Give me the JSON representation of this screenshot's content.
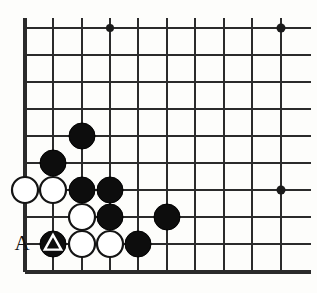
{
  "figure": {
    "kind": "go-board-diagram",
    "board_size": 19,
    "view": {
      "region": "bottom-left corner",
      "visible_columns": 10,
      "visible_rows": 10
    },
    "geometry": {
      "x_lines": [
        25,
        53,
        82,
        110,
        138,
        167,
        195,
        224,
        252,
        281
      ],
      "y_lines": [
        28,
        55,
        82,
        109,
        136,
        163,
        190,
        217,
        244,
        272
      ],
      "edge_right_x": 311,
      "stone_radius": 13,
      "line_color": "#2b2b2b",
      "edge_color": "#2b2b2b",
      "background_color": "#fdfdfb"
    },
    "edges": {
      "left": true,
      "bottom": true,
      "top": false,
      "right": false
    },
    "star_points": [
      {
        "cx": 110,
        "cy": 28,
        "r": 4
      },
      {
        "cx": 281,
        "cy": 28,
        "r": 4.5
      },
      {
        "cx": 281,
        "cy": 190,
        "r": 4.5
      }
    ],
    "stones": [
      {
        "color": "black",
        "cx": 82,
        "cy": 136,
        "marker": "none"
      },
      {
        "color": "black",
        "cx": 53,
        "cy": 163,
        "marker": "none"
      },
      {
        "color": "white",
        "cx": 25,
        "cy": 190,
        "marker": "none"
      },
      {
        "color": "white",
        "cx": 53,
        "cy": 190,
        "marker": "none"
      },
      {
        "color": "black",
        "cx": 82,
        "cy": 190,
        "marker": "none"
      },
      {
        "color": "black",
        "cx": 110,
        "cy": 190,
        "marker": "none"
      },
      {
        "color": "white",
        "cx": 82,
        "cy": 217,
        "marker": "none"
      },
      {
        "color": "black",
        "cx": 110,
        "cy": 217,
        "marker": "none"
      },
      {
        "color": "black",
        "cx": 167,
        "cy": 217,
        "marker": "none"
      },
      {
        "color": "black",
        "cx": 53,
        "cy": 244,
        "marker": "triangle"
      },
      {
        "color": "white",
        "cx": 82,
        "cy": 244,
        "marker": "none"
      },
      {
        "color": "white",
        "cx": 110,
        "cy": 244,
        "marker": "none"
      },
      {
        "color": "black",
        "cx": 138,
        "cy": 244,
        "marker": "none"
      }
    ],
    "labels": [
      {
        "text": "A",
        "x": 22,
        "y": 245
      }
    ]
  }
}
